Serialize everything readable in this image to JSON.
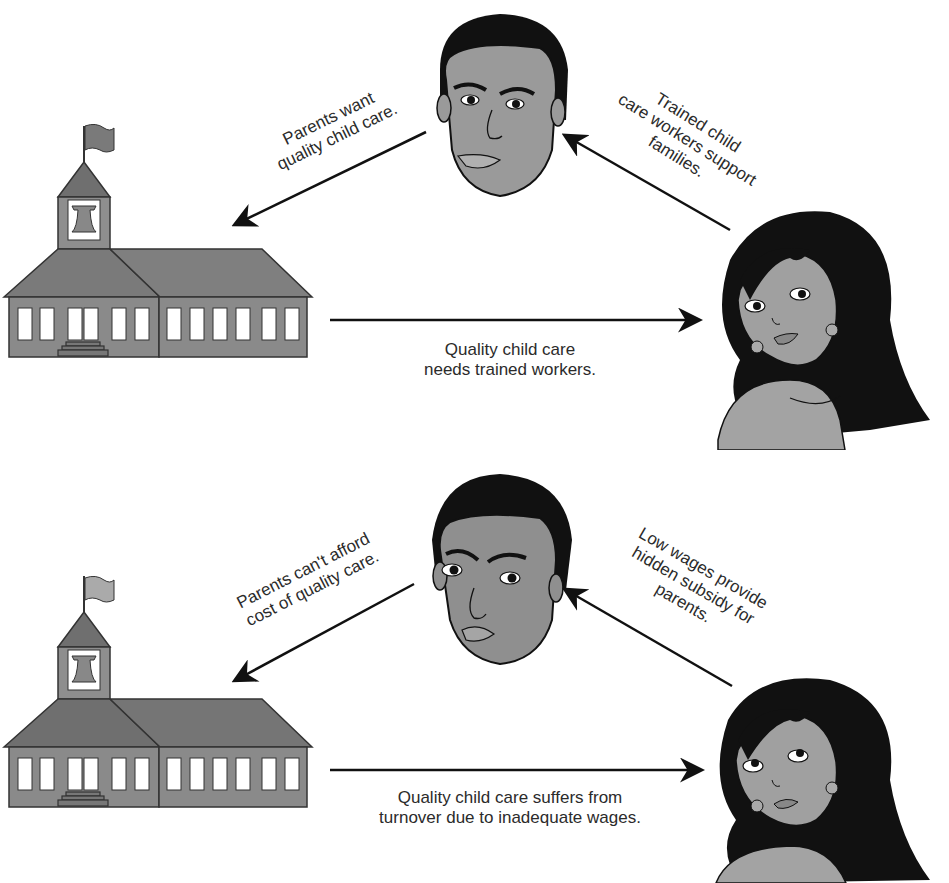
{
  "colors": {
    "background": "#ffffff",
    "building_fill": "#8a8a8a",
    "roof_fill": "#7a7a7a",
    "skin_male": "#9a9a9a",
    "skin_female": "#a0a0a0",
    "hair": "#111111",
    "arrow": "#111111",
    "text": "#2b2b2b"
  },
  "panels": [
    {
      "id": "good-cycle",
      "parent_to_center_label": [
        "Parents want",
        "quality child care."
      ],
      "worker_to_parent_label": [
        "Trained child",
        "care workers support",
        "families."
      ],
      "center_to_worker_label": [
        "Quality child care",
        "needs trained workers."
      ],
      "parent_expression": "smiling",
      "worker_expression": "smiling"
    },
    {
      "id": "bad-cycle",
      "parent_to_center_label": [
        "Parents can't afford",
        "cost of quality care."
      ],
      "worker_to_parent_label": [
        "Low wages provide",
        "hidden subsidy for",
        "parents."
      ],
      "center_to_worker_label": [
        "Quality child care suffers from",
        "turnover due to inadequate wages."
      ],
      "parent_expression": "frowning",
      "worker_expression": "frowning"
    }
  ]
}
